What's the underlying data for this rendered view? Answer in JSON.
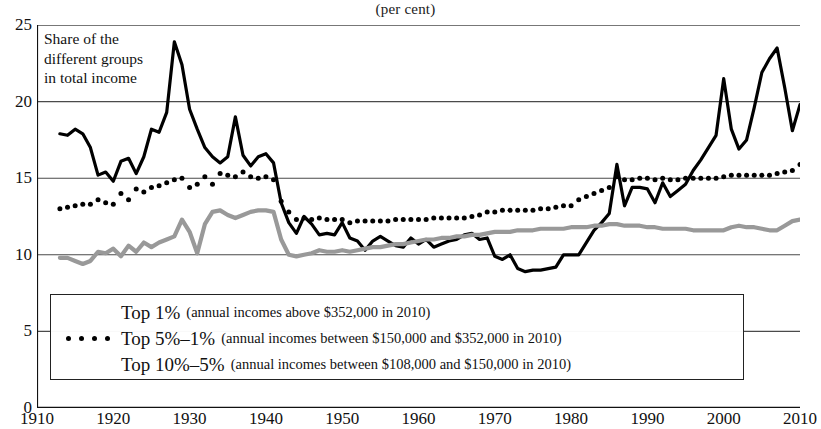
{
  "header": {
    "unit_note": "(per cent)"
  },
  "annotation": {
    "text": "Share of the\ndifferent groups\nin total income"
  },
  "legend": {
    "entries": [
      {
        "name": "Top 1%",
        "detail": "(annual incomes above $352,000 in 2010)",
        "style": "solid",
        "color": "#000000"
      },
      {
        "name": "Top 5%–1%",
        "detail": "(annual incomes between $150,000 and $352,000 in 2010)",
        "style": "dotted",
        "color": "#000000"
      },
      {
        "name": "Top 10%–5%",
        "detail": "(annual incomes between $108,000 and $150,000 in 2010)",
        "style": "solid",
        "color": "#999999"
      }
    ]
  },
  "chart_data": {
    "type": "line",
    "title": "",
    "subtitle": "",
    "xlabel": "",
    "ylabel": "(per cent)",
    "xlim": [
      1910,
      2010
    ],
    "ylim": [
      0,
      25
    ],
    "yticks": [
      0,
      5,
      10,
      15,
      20,
      25
    ],
    "xticks": [
      1910,
      1920,
      1930,
      1940,
      1950,
      1960,
      1970,
      1980,
      1990,
      2000,
      2010
    ],
    "grid": "horizontal",
    "legend_position": "bottom-left-inside",
    "series": [
      {
        "name": "Top 1%",
        "color": "#000000",
        "style": "solid",
        "x": [
          1913,
          1914,
          1915,
          1916,
          1917,
          1918,
          1919,
          1920,
          1921,
          1922,
          1923,
          1924,
          1925,
          1926,
          1927,
          1928,
          1929,
          1930,
          1931,
          1932,
          1933,
          1934,
          1935,
          1936,
          1937,
          1938,
          1939,
          1940,
          1941,
          1942,
          1943,
          1944,
          1945,
          1946,
          1947,
          1948,
          1949,
          1950,
          1951,
          1952,
          1953,
          1954,
          1955,
          1956,
          1957,
          1958,
          1959,
          1960,
          1961,
          1962,
          1963,
          1964,
          1965,
          1966,
          1967,
          1968,
          1969,
          1970,
          1971,
          1972,
          1973,
          1974,
          1975,
          1976,
          1977,
          1978,
          1979,
          1980,
          1981,
          1982,
          1983,
          1984,
          1985,
          1986,
          1987,
          1988,
          1989,
          1990,
          1991,
          1992,
          1993,
          1994,
          1995,
          1996,
          1997,
          1998,
          1999,
          2000,
          2001,
          2002,
          2003,
          2004,
          2005,
          2006,
          2007,
          2008,
          2009,
          2010
        ],
        "y": [
          17.9,
          17.8,
          18.2,
          17.9,
          17.0,
          15.2,
          15.4,
          14.8,
          16.1,
          16.3,
          15.3,
          16.4,
          18.2,
          18.0,
          19.3,
          23.9,
          22.4,
          19.5,
          18.2,
          17.0,
          16.4,
          16.0,
          16.4,
          19.0,
          16.5,
          15.8,
          16.4,
          16.6,
          16.0,
          13.4,
          12.1,
          11.4,
          12.5,
          12.0,
          11.3,
          11.4,
          11.3,
          12.1,
          11.1,
          10.9,
          10.3,
          10.9,
          11.2,
          10.9,
          10.6,
          10.5,
          11.1,
          10.7,
          11.0,
          10.5,
          10.7,
          10.9,
          11.0,
          11.3,
          11.4,
          11.0,
          11.1,
          9.9,
          9.7,
          10.0,
          9.1,
          8.9,
          9.0,
          9.0,
          9.1,
          9.2,
          10.0,
          10.0,
          10.0,
          10.8,
          11.6,
          12.1,
          12.7,
          15.9,
          13.2,
          14.4,
          14.4,
          14.3,
          13.4,
          14.7,
          13.8,
          14.2,
          14.6,
          15.5,
          16.2,
          17.0,
          17.8,
          21.5,
          18.2,
          16.9,
          17.5,
          19.6,
          21.9,
          22.8,
          23.5,
          20.9,
          18.1,
          19.8
        ]
      },
      {
        "name": "Top 5%–1%",
        "color": "#000000",
        "style": "dotted",
        "x": [
          1913,
          1914,
          1915,
          1916,
          1917,
          1918,
          1919,
          1920,
          1921,
          1922,
          1923,
          1924,
          1925,
          1926,
          1927,
          1928,
          1929,
          1930,
          1931,
          1932,
          1933,
          1934,
          1935,
          1936,
          1937,
          1938,
          1939,
          1940,
          1941,
          1942,
          1943,
          1944,
          1945,
          1946,
          1947,
          1948,
          1949,
          1950,
          1951,
          1952,
          1953,
          1954,
          1955,
          1956,
          1957,
          1958,
          1959,
          1960,
          1961,
          1962,
          1963,
          1964,
          1965,
          1966,
          1967,
          1968,
          1969,
          1970,
          1971,
          1972,
          1973,
          1974,
          1975,
          1976,
          1977,
          1978,
          1979,
          1980,
          1981,
          1982,
          1983,
          1984,
          1985,
          1986,
          1987,
          1988,
          1989,
          1990,
          1991,
          1992,
          1993,
          1994,
          1995,
          1996,
          1997,
          1998,
          1999,
          2000,
          2001,
          2002,
          2003,
          2004,
          2005,
          2006,
          2007,
          2008,
          2009,
          2010
        ],
        "y": [
          13.0,
          13.1,
          13.2,
          13.3,
          13.3,
          13.6,
          13.4,
          13.3,
          14.0,
          13.6,
          14.3,
          14.1,
          14.4,
          14.5,
          14.7,
          14.9,
          15.0,
          14.4,
          14.6,
          15.1,
          14.6,
          15.3,
          15.2,
          15.1,
          15.4,
          15.1,
          15.0,
          15.1,
          14.9,
          13.5,
          12.8,
          12.3,
          12.4,
          12.3,
          12.4,
          12.3,
          12.3,
          12.3,
          12.1,
          12.2,
          12.2,
          12.2,
          12.2,
          12.2,
          12.3,
          12.3,
          12.3,
          12.3,
          12.3,
          12.4,
          12.4,
          12.4,
          12.4,
          12.4,
          12.5,
          12.6,
          12.8,
          12.8,
          12.9,
          12.9,
          12.9,
          12.9,
          12.9,
          13.0,
          13.0,
          13.1,
          13.2,
          13.2,
          13.6,
          13.8,
          14.0,
          14.2,
          14.4,
          15.1,
          14.9,
          14.9,
          15.0,
          15.0,
          14.9,
          15.0,
          14.9,
          14.9,
          15.0,
          15.0,
          15.0,
          15.0,
          15.0,
          15.1,
          15.2,
          15.2,
          15.2,
          15.2,
          15.2,
          15.2,
          15.3,
          15.4,
          15.5,
          15.9
        ]
      },
      {
        "name": "Top 10%–5%",
        "color": "#999999",
        "style": "solid",
        "x": [
          1913,
          1914,
          1915,
          1916,
          1917,
          1918,
          1919,
          1920,
          1921,
          1922,
          1923,
          1924,
          1925,
          1926,
          1927,
          1928,
          1929,
          1930,
          1931,
          1932,
          1933,
          1934,
          1935,
          1936,
          1937,
          1938,
          1939,
          1940,
          1941,
          1942,
          1943,
          1944,
          1945,
          1946,
          1947,
          1948,
          1949,
          1950,
          1951,
          1952,
          1953,
          1954,
          1955,
          1956,
          1957,
          1958,
          1959,
          1960,
          1961,
          1962,
          1963,
          1964,
          1965,
          1966,
          1967,
          1968,
          1969,
          1970,
          1971,
          1972,
          1973,
          1974,
          1975,
          1976,
          1977,
          1978,
          1979,
          1980,
          1981,
          1982,
          1983,
          1984,
          1985,
          1986,
          1987,
          1988,
          1989,
          1990,
          1991,
          1992,
          1993,
          1994,
          1995,
          1996,
          1997,
          1998,
          1999,
          2000,
          2001,
          2002,
          2003,
          2004,
          2005,
          2006,
          2007,
          2008,
          2009,
          2010
        ],
        "y": [
          9.8,
          9.8,
          9.6,
          9.4,
          9.6,
          10.2,
          10.1,
          10.4,
          9.9,
          10.6,
          10.2,
          10.8,
          10.5,
          10.8,
          11.0,
          11.2,
          12.3,
          11.5,
          10.1,
          12.0,
          12.8,
          12.9,
          12.6,
          12.4,
          12.6,
          12.8,
          12.9,
          12.9,
          12.8,
          11.0,
          10.0,
          9.9,
          10.0,
          10.1,
          10.3,
          10.2,
          10.2,
          10.3,
          10.2,
          10.3,
          10.4,
          10.5,
          10.5,
          10.6,
          10.7,
          10.7,
          10.8,
          10.9,
          11.0,
          11.0,
          11.1,
          11.1,
          11.2,
          11.2,
          11.3,
          11.3,
          11.4,
          11.5,
          11.5,
          11.5,
          11.6,
          11.6,
          11.6,
          11.7,
          11.7,
          11.7,
          11.7,
          11.8,
          11.8,
          11.8,
          11.9,
          11.9,
          12.0,
          12.0,
          11.9,
          11.9,
          11.9,
          11.8,
          11.8,
          11.7,
          11.7,
          11.7,
          11.7,
          11.6,
          11.6,
          11.6,
          11.6,
          11.6,
          11.8,
          11.9,
          11.8,
          11.8,
          11.7,
          11.6,
          11.6,
          11.9,
          12.2,
          12.3
        ]
      }
    ]
  }
}
